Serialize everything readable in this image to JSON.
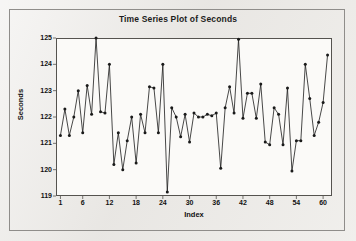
{
  "chart_data": {
    "type": "line",
    "title": "Time Series Plot of Seconds",
    "xlabel": "Index",
    "ylabel": "Seconds",
    "grid": false,
    "legend": "none",
    "marker": "filled-circle",
    "line_color": "#1a1a1a",
    "marker_color": "#1a1a1a",
    "xlim": [
      0,
      62
    ],
    "ylim": [
      119,
      125
    ],
    "yticks": [
      119,
      120,
      121,
      122,
      123,
      124,
      125
    ],
    "xticks": [
      1,
      6,
      12,
      18,
      24,
      30,
      36,
      42,
      48,
      54,
      60
    ],
    "x": [
      1,
      2,
      3,
      4,
      5,
      6,
      7,
      8,
      9,
      10,
      11,
      12,
      13,
      14,
      15,
      16,
      17,
      18,
      19,
      20,
      21,
      22,
      23,
      24,
      25,
      26,
      27,
      28,
      29,
      30,
      31,
      32,
      33,
      34,
      35,
      36,
      37,
      38,
      39,
      40,
      41,
      42,
      43,
      44,
      45,
      46,
      47,
      48,
      49,
      50,
      51,
      52,
      53,
      54,
      55,
      56,
      57,
      58,
      59,
      60,
      61
    ],
    "values": [
      121.3,
      122.3,
      121.3,
      122.0,
      123.0,
      121.4,
      123.2,
      122.1,
      125.0,
      122.2,
      122.15,
      124.0,
      120.2,
      121.4,
      120.0,
      121.1,
      122.0,
      120.25,
      122.1,
      121.4,
      123.15,
      123.1,
      121.4,
      124.0,
      119.15,
      122.35,
      122.0,
      121.25,
      122.1,
      121.05,
      122.15,
      122.0,
      122.0,
      122.1,
      122.05,
      122.15,
      120.05,
      122.35,
      123.15,
      122.15,
      124.95,
      121.95,
      122.9,
      122.9,
      121.95,
      123.25,
      121.05,
      120.95,
      122.35,
      122.1,
      120.95,
      123.1,
      119.95,
      121.1,
      121.1,
      124.0,
      122.7,
      121.3,
      121.8,
      122.55,
      124.35
    ]
  }
}
